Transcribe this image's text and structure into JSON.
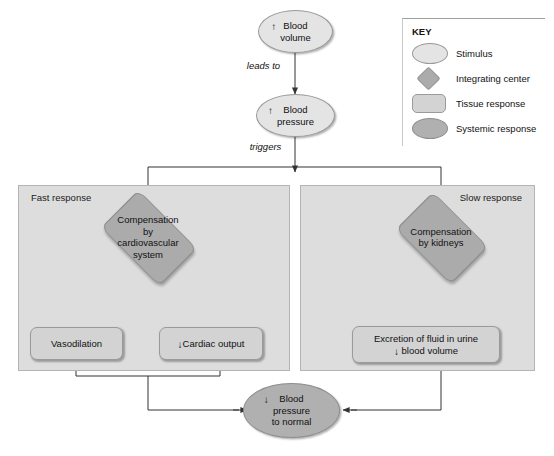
{
  "figure": {
    "background_color": "#ffffff"
  },
  "colors": {
    "stimulus_fill": "#e4e4e4",
    "integrating_center_fill": "#ababab",
    "tissue_response_fill": "#d3d3d3",
    "systemic_response_fill": "#b0b0b0",
    "panel_fill": "#dddddd",
    "panel_border": "#b4b4b4",
    "line": "#333333",
    "text": "#111111"
  },
  "nodes": {
    "blood_volume": {
      "shape": "ellipse",
      "type": "stimulus",
      "arrow": "↑",
      "line1": "Blood",
      "line2": "volume"
    },
    "blood_pressure": {
      "shape": "ellipse",
      "type": "stimulus",
      "arrow": "↑",
      "line1": "Blood",
      "line2": "pressure"
    },
    "cardiovascular": {
      "shape": "diamond",
      "type": "integrating-center",
      "line1": "Compensation",
      "line2": "by",
      "line3": "cardiovascular",
      "line4": "system"
    },
    "kidneys": {
      "shape": "diamond",
      "type": "integrating-center",
      "line1": "Compensation",
      "line2": "by kidneys"
    },
    "vasodilation": {
      "shape": "rounded-rect",
      "type": "tissue-response",
      "label": "Vasodilation"
    },
    "cardiac_output": {
      "shape": "rounded-rect",
      "type": "tissue-response",
      "arrow": "↓",
      "label": "Cardiac output"
    },
    "excretion": {
      "shape": "rounded-rect",
      "type": "tissue-response",
      "line1": "Excretion of fluid in urine",
      "arrow": "↓",
      "line2": "blood volume"
    },
    "bp_normal": {
      "shape": "ellipse",
      "type": "systemic-response",
      "arrow": "↓",
      "line1": "Blood",
      "line2": "pressure",
      "line3": "to normal"
    }
  },
  "edge_labels": {
    "leads_to": "leads to",
    "triggers": "triggers"
  },
  "panels": {
    "fast": {
      "label": "Fast response"
    },
    "slow": {
      "label": "Slow response"
    }
  },
  "key": {
    "title": "KEY",
    "items": [
      {
        "shape": "ellipse",
        "label": "Stimulus"
      },
      {
        "shape": "diamond",
        "label": "Integrating center"
      },
      {
        "shape": "rounded-rect",
        "label": "Tissue response"
      },
      {
        "shape": "ellipse-dark",
        "label": "Systemic response"
      }
    ]
  }
}
